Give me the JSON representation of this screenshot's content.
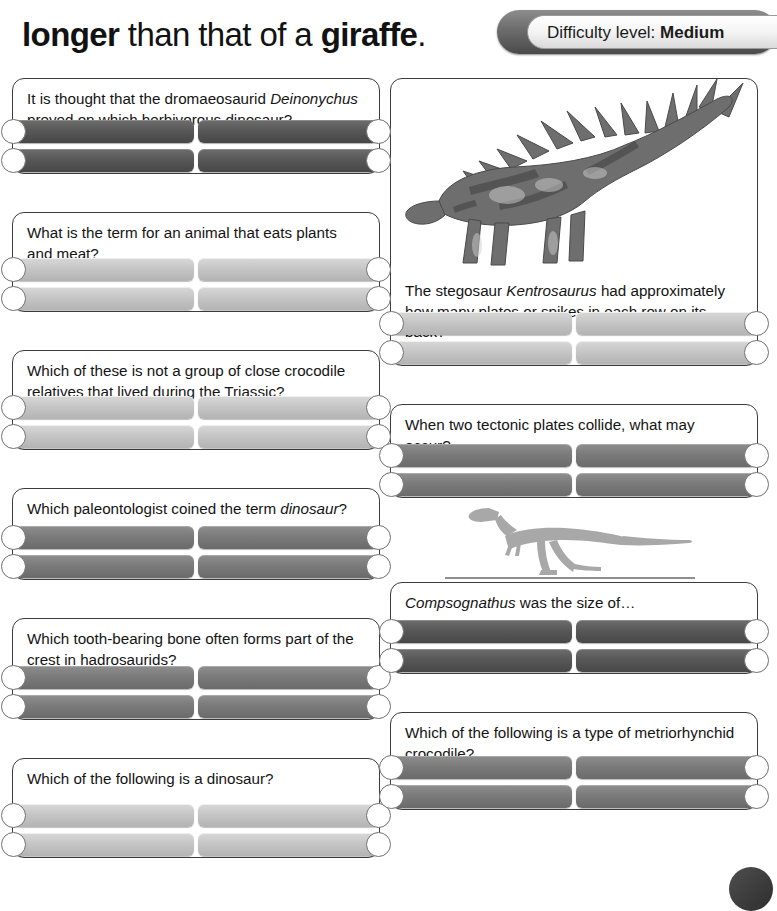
{
  "header": {
    "headline_parts": [
      {
        "text": "longer",
        "bold": true
      },
      {
        "text": " than that of a ",
        "bold": false
      },
      {
        "text": "giraffe",
        "bold": true
      },
      {
        "text": ".",
        "bold": false
      }
    ],
    "headline_plain": "longer than that of a giraffe.",
    "difficulty_label": "Difficulty level:",
    "difficulty_value": "Medium"
  },
  "images": {
    "kentrosaurus_caption": "kentrosaurus-illustration",
    "compsognathus_caption": "compsognathus-silhouette"
  },
  "left_column": [
    {
      "number": "11",
      "question_html": "It is thought that the dromaeosaurid <i>Deinonychus</i> preyed on which herbivorous dinosaur?",
      "style": "dark",
      "italic": true,
      "answers": [
        {
          "letter": "a",
          "text": "Brachiosaurus"
        },
        {
          "letter": "b",
          "text": "Ornitholestes"
        },
        {
          "letter": "c",
          "text": "Valdosaurus"
        },
        {
          "letter": "d",
          "text": "Tenontosaurus"
        }
      ]
    },
    {
      "number": "12",
      "question_html": "What is the term for an animal that eats plants and meat?",
      "style": "light",
      "italic": false,
      "answers": [
        {
          "letter": "a",
          "text": "Carnivore"
        },
        {
          "letter": "b",
          "text": "Frugivore"
        },
        {
          "letter": "c",
          "text": "Omnivore"
        },
        {
          "letter": "d",
          "text": "Herbivore"
        }
      ]
    },
    {
      "number": "13",
      "question_html": "Which of these is not a group of close crocodile relatives that lived during the Triassic?",
      "style": "light",
      "italic": false,
      "answers": [
        {
          "letter": "a",
          "text": "Rauisuchians"
        },
        {
          "letter": "b",
          "text": "Ichthyostegids"
        },
        {
          "letter": "c",
          "text": "Phytosaurs"
        },
        {
          "letter": "d",
          "text": "Aetosaurs"
        }
      ]
    },
    {
      "number": "14",
      "question_html": "Which paleontologist coined the term <i>dinosaur</i>?",
      "style": "mid",
      "italic": false,
      "answers": [
        {
          "letter": "a",
          "text": "Roger Benson"
        },
        {
          "letter": "b",
          "text": "Richard Owen"
        },
        {
          "letter": "c",
          "text": "E. D. Cope"
        },
        {
          "letter": "d",
          "text": "Charles Darwin"
        }
      ]
    },
    {
      "number": "15",
      "question_html": "Which tooth-bearing bone often forms part of the crest in hadrosaurids?",
      "style": "mid",
      "italic": false,
      "answers": [
        {
          "letter": "a",
          "text": "Premaxilla"
        },
        {
          "letter": "b",
          "text": "Dentary"
        },
        {
          "letter": "c",
          "text": "Femur"
        },
        {
          "letter": "d",
          "text": "Humerus"
        }
      ]
    },
    {
      "number": "16",
      "question_html": "Which of the following is a dinosaur?",
      "style": "light",
      "italic": true,
      "answers": [
        {
          "letter": "a",
          "text": "Steneosaurus"
        },
        {
          "letter": "b",
          "text": "Parasaurolophus"
        },
        {
          "letter": "c",
          "text": "Batrachotomus"
        },
        {
          "letter": "d",
          "text": "Felis"
        }
      ]
    }
  ],
  "right_column": [
    {
      "number": "17",
      "question_html": "The stegosaur <i>Kentrosaurus</i> had approximately how many plates or spikes in each row on its back?",
      "style": "light",
      "italic": false,
      "answers": [
        {
          "letter": "a",
          "text": "3"
        },
        {
          "letter": "b",
          "text": "35"
        },
        {
          "letter": "c",
          "text": "100"
        },
        {
          "letter": "d",
          "text": "15"
        }
      ]
    },
    {
      "number": "18",
      "question_html": "When two tectonic plates collide, what may occur?",
      "style": "mid",
      "italic": false,
      "answers": [
        {
          "letter": "a",
          "text": "Rain"
        },
        {
          "letter": "b",
          "text": "Wind"
        },
        {
          "letter": "c",
          "text": "Extinction"
        },
        {
          "letter": "d",
          "text": "Earthquake"
        }
      ]
    },
    {
      "number": "19",
      "question_html": "<i>Compsognathus</i> was the size of…",
      "style": "dark",
      "italic": false,
      "answers": [
        {
          "letter": "a",
          "text": "A pigeon"
        },
        {
          "letter": "b",
          "text": "A turkey"
        },
        {
          "letter": "c",
          "text": "A sparrow"
        },
        {
          "letter": "d",
          "text": "An ostrich"
        }
      ]
    },
    {
      "number": "20",
      "question_html": "Which of the following is a type of metriorhynchid crocodile?",
      "style": "mid",
      "italic": true,
      "answers": [
        {
          "letter": "a",
          "text": "Troodon"
        },
        {
          "letter": "b",
          "text": "Titanosaurus"
        },
        {
          "letter": "c",
          "text": "Rhamphorhynchus"
        },
        {
          "letter": "d",
          "text": "Dakosaurus"
        }
      ]
    }
  ],
  "colors": {
    "card_border": "#3c3c3c",
    "answer_dark": "#585858",
    "answer_mid": "#7b7b7b",
    "answer_light": "#c6c6c6",
    "badge_ring": "#707070",
    "text": "#141414"
  }
}
